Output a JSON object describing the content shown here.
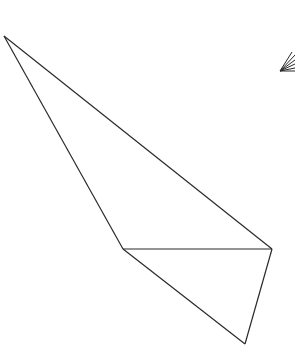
{
  "canvas": {
    "width": 295,
    "height": 347,
    "background": "#ffffff"
  },
  "stroke": {
    "color": "#2a2a2a",
    "width": 1.2
  },
  "vertices": {
    "A": [
      4,
      36
    ],
    "B": [
      123,
      249
    ],
    "C": [
      272,
      249
    ],
    "D": [
      245,
      344
    ]
  },
  "edges": [
    [
      "A",
      "B"
    ],
    [
      "A",
      "C"
    ],
    [
      "B",
      "C"
    ],
    [
      "B",
      "D"
    ],
    [
      "C",
      "D"
    ]
  ],
  "fan": {
    "apex": [
      280,
      71
    ],
    "rays": [
      [
        292,
        52
      ],
      [
        295,
        55
      ],
      [
        295,
        60
      ],
      [
        295,
        64
      ],
      [
        295,
        68
      ],
      [
        295,
        71
      ]
    ]
  }
}
